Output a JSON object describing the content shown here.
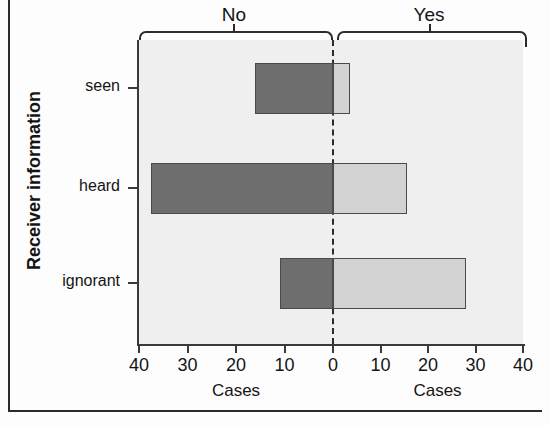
{
  "chart_data": {
    "type": "bar",
    "orientation": "horizontal",
    "style": "back-to-back / bidirectional population pyramid",
    "title": "",
    "categories": [
      "seen",
      "heard",
      "ignorant"
    ],
    "series": [
      {
        "name": "No",
        "side": "left",
        "color": "#6e6e6e",
        "values": [
          16,
          37.5,
          11
        ]
      },
      {
        "name": "Yes",
        "side": "right",
        "color": "#d2d2d2",
        "values": [
          3.5,
          15.5,
          28
        ]
      }
    ],
    "xlabel_left": "Cases",
    "xlabel_right": "Cases",
    "ylabel": "Receiver information",
    "xticks_left": [
      "40",
      "30",
      "20",
      "10",
      "0"
    ],
    "xticks_right": [
      "10",
      "20",
      "30",
      "40"
    ],
    "xticks_all": [
      "40",
      "30",
      "20",
      "10",
      "0",
      "10",
      "20",
      "30",
      "40"
    ],
    "xlim_left": [
      0,
      40
    ],
    "xlim_right": [
      0,
      40
    ],
    "grid": false,
    "legend": "none (top braces label the two halves)",
    "annotations": [
      {
        "text": "No",
        "position": "top-left-brace"
      },
      {
        "text": "Yes",
        "position": "top-right-brace"
      }
    ]
  },
  "axes": {
    "y_title": "Receiver information",
    "categories": [
      {
        "label": "seen",
        "no": 16,
        "yes": 3.5
      },
      {
        "label": "heard",
        "no": 37.5,
        "yes": 15.5
      },
      {
        "label": "ignorant",
        "no": 11,
        "yes": 28
      }
    ],
    "x_left": {
      "title": "Cases",
      "ticks": [
        "40",
        "30",
        "20",
        "10",
        "0"
      ]
    },
    "x_right": {
      "title": "Cases",
      "ticks": [
        "10",
        "20",
        "30",
        "40"
      ]
    }
  },
  "braces": {
    "left_label": "No",
    "right_label": "Yes"
  },
  "colors": {
    "bar_no": "#6e6e6e",
    "bar_yes": "#d2d2d2",
    "panel": "#efefef",
    "axis": "#3a3a3a",
    "frame": "#2b2b2b",
    "text": "#141414"
  }
}
